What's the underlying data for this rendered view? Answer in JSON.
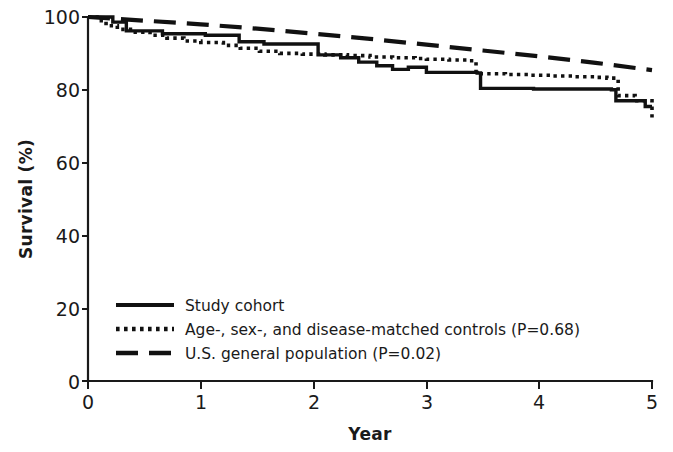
{
  "chart_data": {
    "type": "line",
    "title": "",
    "subtitle": "",
    "xlabel": "Year",
    "ylabel": "Survival (%)",
    "xlim": [
      0,
      5
    ],
    "ylim": [
      0,
      100
    ],
    "xticks": [
      "0",
      "1",
      "2",
      "3",
      "4",
      "5"
    ],
    "yticks": [
      "0",
      "20",
      "40",
      "60",
      "80",
      "100"
    ],
    "xtick_values": [
      0,
      1,
      2,
      3,
      4,
      5
    ],
    "ytick_values": [
      0,
      20,
      40,
      60,
      80,
      100
    ],
    "grid": false,
    "legend_position": "lower-left-inside",
    "curve_style": "kaplan-meier step",
    "series": [
      {
        "name": "Study cohort",
        "style": "solid",
        "color": "#111111",
        "annotation": "",
        "points": [
          [
            0.0,
            100.0
          ],
          [
            0.18,
            100.0
          ],
          [
            0.22,
            98.6
          ],
          [
            0.3,
            98.6
          ],
          [
            0.34,
            96.2
          ],
          [
            0.62,
            96.2
          ],
          [
            0.66,
            95.4
          ],
          [
            1.0,
            95.4
          ],
          [
            1.04,
            95.0
          ],
          [
            1.3,
            95.0
          ],
          [
            1.34,
            93.2
          ],
          [
            1.52,
            93.2
          ],
          [
            1.56,
            92.6
          ],
          [
            1.95,
            92.6
          ],
          [
            2.0,
            92.6
          ],
          [
            2.04,
            89.6
          ],
          [
            2.2,
            89.6
          ],
          [
            2.24,
            88.8
          ],
          [
            2.36,
            88.8
          ],
          [
            2.4,
            87.6
          ],
          [
            2.52,
            87.6
          ],
          [
            2.56,
            86.6
          ],
          [
            2.66,
            86.6
          ],
          [
            2.7,
            85.6
          ],
          [
            2.8,
            85.6
          ],
          [
            2.84,
            86.2
          ],
          [
            2.95,
            86.2
          ],
          [
            3.0,
            84.8
          ],
          [
            3.4,
            84.8
          ],
          [
            3.45,
            84.6
          ],
          [
            3.48,
            80.4
          ],
          [
            3.9,
            80.4
          ],
          [
            3.95,
            80.2
          ],
          [
            4.3,
            80.2
          ],
          [
            4.6,
            80.2
          ],
          [
            4.64,
            80.0
          ],
          [
            4.68,
            77.0
          ],
          [
            4.9,
            77.0
          ],
          [
            4.94,
            75.4
          ],
          [
            5.0,
            75.4
          ]
        ],
        "start_value": 100.0,
        "end_value": 75.4
      },
      {
        "name": "Age-, sex-, and disease-matched controls (P=0.68)",
        "style": "dotted",
        "color": "#111111",
        "annotation": "P=0.68",
        "p_value": "0.68",
        "points": [
          [
            0.0,
            100.0
          ],
          [
            0.08,
            99.0
          ],
          [
            0.16,
            97.6
          ],
          [
            0.26,
            96.6
          ],
          [
            0.4,
            95.8
          ],
          [
            0.55,
            95.0
          ],
          [
            0.7,
            94.2
          ],
          [
            0.85,
            93.4
          ],
          [
            1.0,
            93.0
          ],
          [
            1.2,
            92.2
          ],
          [
            1.35,
            91.4
          ],
          [
            1.52,
            90.6
          ],
          [
            1.7,
            90.0
          ],
          [
            1.9,
            89.8
          ],
          [
            2.1,
            89.6
          ],
          [
            2.3,
            89.4
          ],
          [
            2.5,
            89.0
          ],
          [
            2.7,
            88.8
          ],
          [
            2.9,
            88.6
          ],
          [
            3.0,
            88.4
          ],
          [
            3.2,
            88.2
          ],
          [
            3.38,
            88.0
          ],
          [
            3.44,
            84.4
          ],
          [
            3.7,
            84.2
          ],
          [
            3.9,
            84.0
          ],
          [
            4.1,
            83.8
          ],
          [
            4.3,
            83.6
          ],
          [
            4.5,
            83.4
          ],
          [
            4.6,
            83.2
          ],
          [
            4.7,
            78.4
          ],
          [
            4.85,
            77.0
          ],
          [
            5.0,
            72.4
          ]
        ],
        "start_value": 100.0,
        "end_value": 72.4
      },
      {
        "name": "U.S. general population (P=0.02)",
        "style": "dashed",
        "color": "#111111",
        "annotation": "P=0.02",
        "p_value": "0.02",
        "points": [
          [
            0.0,
            100.0
          ],
          [
            0.5,
            99.0
          ],
          [
            1.0,
            98.0
          ],
          [
            1.5,
            96.8
          ],
          [
            2.0,
            95.4
          ],
          [
            2.5,
            94.0
          ],
          [
            3.0,
            92.4
          ],
          [
            3.5,
            90.8
          ],
          [
            4.0,
            89.2
          ],
          [
            4.5,
            87.4
          ],
          [
            5.0,
            85.4
          ]
        ],
        "start_value": 100.0,
        "end_value": 85.4
      }
    ]
  },
  "legend": {
    "items": [
      {
        "label": "Study cohort",
        "style": "solid"
      },
      {
        "label": "Age-, sex-, and disease-matched controls (P=0.68)",
        "style": "dotted"
      },
      {
        "label": "U.S. general population (P=0.02)",
        "style": "dashed"
      }
    ]
  },
  "axes": {
    "y_title": "Survival (%)",
    "x_title": "Year",
    "y_labels": [
      "100",
      "80",
      "60",
      "40",
      "20",
      "0"
    ],
    "x_labels": [
      "0",
      "1",
      "2",
      "3",
      "4",
      "5"
    ]
  },
  "colors": {
    "ink": "#111111",
    "background": "#ffffff"
  }
}
